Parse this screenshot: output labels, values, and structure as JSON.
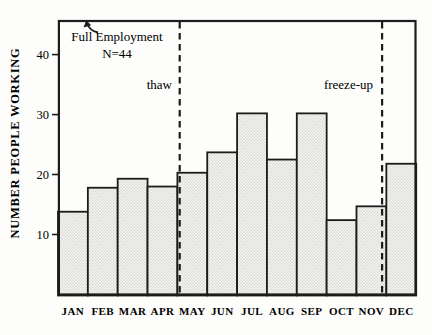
{
  "figure": {
    "background_color": "#fdfdfb",
    "ink_color": "#1c1c1c",
    "bar_fill_color": "#f2f2ef",
    "bar_dot_color": "#bcbcb9"
  },
  "chart_data": {
    "type": "bar",
    "title": "",
    "xlabel": "",
    "ylabel": "NUMBER PEOPLE WORKING",
    "categories": [
      "JAN",
      "FEB",
      "MAR",
      "APR",
      "MAY",
      "JUN",
      "JUL",
      "AUG",
      "SEP",
      "OCT",
      "NOV",
      "DEC"
    ],
    "values": [
      13.8,
      17.8,
      19.3,
      18,
      20.3,
      23.7,
      30.2,
      22.5,
      30.2,
      12.4,
      14.7,
      21.8
    ],
    "yticks": [
      10,
      20,
      30,
      40
    ],
    "ylim": [
      0,
      45.6
    ],
    "grid": false,
    "legend": null,
    "bar_style": "stippled light gray fill with black outline, contiguous bars",
    "vlines": [
      {
        "label": "thaw",
        "between": [
          "APR",
          "MAY"
        ],
        "style": "dashed"
      },
      {
        "label": "freeze-up",
        "between": [
          "NOV",
          "DEC"
        ],
        "style": "dashed"
      }
    ],
    "annotations": [
      {
        "text": "Full Employment",
        "line2": "N=44",
        "arrow_to": "top frame line (full employment level)"
      },
      {
        "text": "thaw",
        "position": "left of first dashed line"
      },
      {
        "text": "freeze-up",
        "position": "left of second dashed line"
      }
    ]
  }
}
